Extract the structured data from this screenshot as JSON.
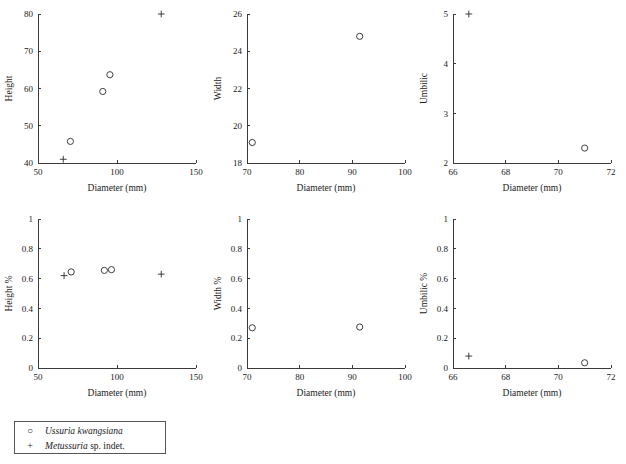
{
  "figure": {
    "background": "#ffffff",
    "marker_color": "#2b2b2b",
    "axis_color": "#3a3a3a"
  },
  "legend": {
    "entries": [
      {
        "symbol": "○",
        "symbol_name": "open-circle-marker",
        "genus": "Ussuria kwangsiana",
        "qualifier": ""
      },
      {
        "symbol": "+",
        "symbol_name": "plus-cross-marker",
        "genus": "Metussuria",
        "qualifier": " sp. indet."
      }
    ]
  },
  "chart_data": [
    {
      "id": "height-vs-diameter",
      "type": "scatter",
      "title": "",
      "xlabel": "Diameter (mm)",
      "ylabel": "Height",
      "xlim": [
        50,
        150
      ],
      "ylim": [
        40,
        80
      ],
      "xticks": [
        50,
        100,
        150
      ],
      "yticks": [
        40,
        50,
        60,
        70,
        80
      ],
      "xtick_labels": [
        "50",
        "100",
        "150"
      ],
      "ytick_labels": [
        "40",
        "50",
        "60",
        "70",
        "80"
      ],
      "grid": false,
      "series": [
        {
          "name": "Ussuria kwangsiana",
          "marker": "circle",
          "points": [
            [
              70.5,
              45.8
            ],
            [
              91.0,
              59.2
            ],
            [
              95.5,
              63.7
            ]
          ]
        },
        {
          "name": "Metussuria sp. indet.",
          "marker": "cross",
          "points": [
            [
              66.0,
              41.0
            ],
            [
              128.0,
              80.0
            ]
          ]
        }
      ]
    },
    {
      "id": "width-vs-diameter",
      "type": "scatter",
      "title": "",
      "xlabel": "Diameter (mm)",
      "ylabel": "Width",
      "xlim": [
        70,
        100
      ],
      "ylim": [
        18,
        26
      ],
      "xticks": [
        70,
        80,
        90,
        100
      ],
      "yticks": [
        18,
        20,
        22,
        24,
        26
      ],
      "xtick_labels": [
        "70",
        "80",
        "90",
        "100"
      ],
      "ytick_labels": [
        "18",
        "20",
        "22",
        "24",
        "26"
      ],
      "grid": false,
      "series": [
        {
          "name": "Ussuria kwangsiana",
          "marker": "circle",
          "points": [
            [
              71.0,
              19.1
            ],
            [
              91.4,
              24.8
            ]
          ]
        }
      ]
    },
    {
      "id": "umbilic-vs-diameter",
      "type": "scatter",
      "title": "",
      "xlabel": "Diameter (mm)",
      "ylabel": "Umbilic",
      "xlim": [
        66,
        72
      ],
      "ylim": [
        2,
        5
      ],
      "xticks": [
        66,
        68,
        70,
        72
      ],
      "yticks": [
        2,
        3,
        4,
        5
      ],
      "xtick_labels": [
        "66",
        "68",
        "70",
        "72"
      ],
      "ytick_labels": [
        "2",
        "3",
        "4",
        "5"
      ],
      "grid": false,
      "series": [
        {
          "name": "Ussuria kwangsiana",
          "marker": "circle",
          "points": [
            [
              71.0,
              2.3
            ]
          ]
        },
        {
          "name": "Metussuria sp. indet.",
          "marker": "cross",
          "points": [
            [
              66.6,
              5.0
            ]
          ]
        }
      ]
    },
    {
      "id": "height-percent-vs-diameter",
      "type": "scatter",
      "title": "",
      "xlabel": "Diameter (mm)",
      "ylabel": "Height %",
      "xlim": [
        50,
        150
      ],
      "ylim": [
        0,
        1
      ],
      "xticks": [
        50,
        100,
        150
      ],
      "yticks": [
        0,
        0.2,
        0.4,
        0.6,
        0.8,
        1
      ],
      "xtick_labels": [
        "50",
        "100",
        "150"
      ],
      "ytick_labels": [
        "0",
        "0.2",
        "0.4",
        "0.6",
        "0.8",
        "1"
      ],
      "grid": false,
      "series": [
        {
          "name": "Ussuria kwangsiana",
          "marker": "circle",
          "points": [
            [
              71.0,
              0.645
            ],
            [
              92.0,
              0.655
            ],
            [
              96.5,
              0.66
            ]
          ]
        },
        {
          "name": "Metussuria sp. indet.",
          "marker": "cross",
          "points": [
            [
              66.5,
              0.62
            ],
            [
              128.0,
              0.63
            ]
          ]
        }
      ]
    },
    {
      "id": "width-percent-vs-diameter",
      "type": "scatter",
      "title": "",
      "xlabel": "Diameter (mm)",
      "ylabel": "Width %",
      "xlim": [
        70,
        100
      ],
      "ylim": [
        0,
        1
      ],
      "xticks": [
        70,
        80,
        90,
        100
      ],
      "yticks": [
        0,
        0.2,
        0.4,
        0.6,
        0.8,
        1
      ],
      "xtick_labels": [
        "70",
        "80",
        "90",
        "100"
      ],
      "ytick_labels": [
        "0",
        "0.2",
        "0.4",
        "0.6",
        "0.8",
        "1"
      ],
      "grid": false,
      "series": [
        {
          "name": "Ussuria kwangsiana",
          "marker": "circle",
          "points": [
            [
              71.0,
              0.27
            ],
            [
              91.4,
              0.275
            ]
          ]
        }
      ]
    },
    {
      "id": "umbilic-percent-vs-diameter",
      "type": "scatter",
      "title": "",
      "xlabel": "Diameter (mm)",
      "ylabel": "Umbilic %",
      "xlim": [
        66,
        72
      ],
      "ylim": [
        0,
        1
      ],
      "xticks": [
        66,
        68,
        70,
        72
      ],
      "yticks": [
        0,
        0.2,
        0.4,
        0.6,
        0.8,
        1
      ],
      "xtick_labels": [
        "66",
        "68",
        "70",
        "72"
      ],
      "ytick_labels": [
        "0",
        "0.2",
        "0.4",
        "0.6",
        "0.8",
        "1"
      ],
      "grid": false,
      "series": [
        {
          "name": "Ussuria kwangsiana",
          "marker": "circle",
          "points": [
            [
              71.0,
              0.035
            ]
          ]
        },
        {
          "name": "Metussuria sp. indet.",
          "marker": "cross",
          "points": [
            [
              66.6,
              0.08
            ]
          ]
        }
      ]
    }
  ]
}
